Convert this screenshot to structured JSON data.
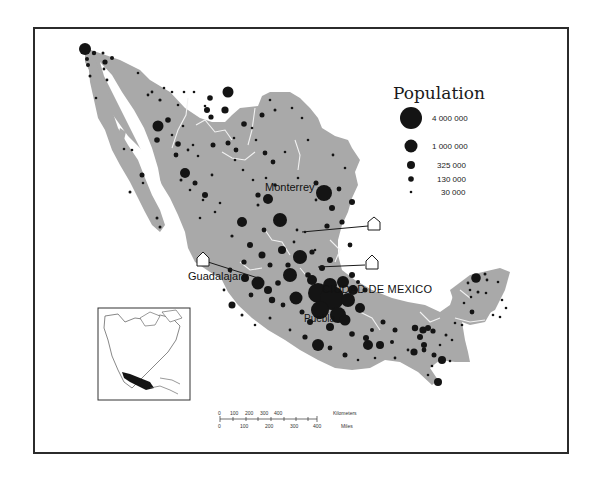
{
  "colors": {
    "land": "#a9a9a9",
    "dot": "#141414",
    "border_lines": "#f2f2f2",
    "frame": "#2b2b2b",
    "background": "#ffffff"
  },
  "legend": {
    "title": "Population",
    "items": [
      {
        "label": "4 000 000",
        "radius": 11
      },
      {
        "label": "1 000 000",
        "radius": 7
      },
      {
        "label": "325 000",
        "radius": 4.2
      },
      {
        "label": "130 000",
        "radius": 2.8
      },
      {
        "label": "30 000",
        "radius": 1.4
      }
    ]
  },
  "cities": {
    "monterrey": "Monterrey",
    "guadalajara": "Guadalajara",
    "mexico_city": "CIUDAD DE MEXICO",
    "puebla": "Puebla"
  },
  "scale_bar": {
    "km_label": "Kilometers",
    "miles_label": "Miles",
    "km_ticks": [
      "0",
      "100",
      "200",
      "300",
      "400"
    ],
    "mile_ticks": [
      "0",
      "100",
      "200",
      "300",
      "400"
    ]
  },
  "inset": {
    "label": "North America locator map",
    "highlight": "Mexico"
  },
  "map": {
    "subject": "Mexico",
    "symbol": "graduated-circles",
    "callouts": 3
  }
}
